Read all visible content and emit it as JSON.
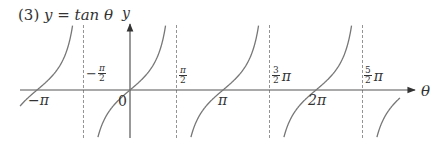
{
  "title": {
    "number": "(3)",
    "equation": "y = tan θ"
  },
  "axes": {
    "x_label": "θ",
    "y_label": "y",
    "origin_label": "0"
  },
  "tick_labels": {
    "neg_pi": "−π",
    "neg_half_pi_sign": "−",
    "neg_half_pi_num": "π",
    "neg_half_pi_den": "2",
    "half_pi_num": "π",
    "half_pi_den": "2",
    "pi": "π",
    "three_half_num": "3",
    "three_half_den": "2",
    "three_half_pi": "π",
    "two_pi": "2π",
    "five_half_num": "5",
    "five_half_den": "2",
    "five_half_pi": "π"
  },
  "colors": {
    "curve": "#777777",
    "axis": "#444444",
    "asymptote": "#888888"
  },
  "chart_data": {
    "type": "line",
    "function": "tan(theta)",
    "xlabel": "θ",
    "ylabel": "y",
    "x_ticks": [
      "−π",
      "−π/2",
      "0",
      "π/2",
      "π",
      "3/2 π",
      "2π",
      "5/2 π"
    ],
    "x_tick_values": [
      -3.1416,
      -1.5708,
      0,
      1.5708,
      3.1416,
      4.7124,
      6.2832,
      7.854
    ],
    "asymptotes": [
      "−π/2",
      "π/2",
      "3/2 π",
      "5/2 π"
    ],
    "asymptote_values": [
      -1.5708,
      1.5708,
      4.7124,
      7.854
    ],
    "zeros": [
      -3.1416,
      0,
      3.1416,
      6.2832
    ],
    "xlim": [
      -3.35,
      8.95
    ],
    "ylim": [
      -1.8,
      2.3
    ],
    "grid": false,
    "legend": null,
    "series": [
      {
        "name": "branch 1",
        "domain": [
          "≈-3.5",
          "-π/2"
        ],
        "description": "tan θ branch through (−π, 0)"
      },
      {
        "name": "branch 2",
        "domain": [
          "-π/2",
          "π/2"
        ],
        "description": "tan θ branch through (0, 0)"
      },
      {
        "name": "branch 3",
        "domain": [
          "π/2",
          "3π/2"
        ],
        "description": "tan θ branch through (π, 0)"
      },
      {
        "name": "branch 4",
        "domain": [
          "3π/2",
          "5π/2"
        ],
        "description": "tan θ branch through (2π, 0)"
      },
      {
        "name": "branch 5",
        "domain": [
          "5π/2",
          "≈3π+0.3"
        ],
        "description": "tan θ branch through (3π, 0)"
      }
    ]
  }
}
